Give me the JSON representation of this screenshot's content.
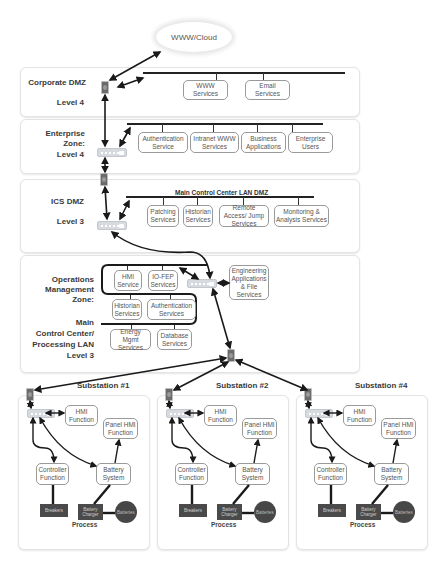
{
  "cloud": {
    "label": "WWW/Cloud"
  },
  "zones": {
    "corporate_dmz": {
      "title": "Corporate DMZ",
      "level": "Level 4",
      "services": [
        "WWW Services",
        "Email Services"
      ]
    },
    "enterprise": {
      "title": "Enterprise Zone:",
      "level": "Level 4",
      "services": [
        "Authentication Service",
        "Intranet WWW Services",
        "Business Applications",
        "Enterprise Users"
      ]
    },
    "ics_dmz": {
      "title": "ICS DMZ",
      "level": "Level 3",
      "bus_label": "Main Control Center LAN DMZ",
      "services": [
        "Patching Services",
        "Historian Services",
        "Remote Access/ Jump Services",
        "Monitoring & Analysis Services"
      ]
    },
    "operations": {
      "title_line1": "Operations",
      "title_line2": "Management Zone:",
      "main_line1": "Main",
      "main_line2": "Control Center/",
      "main_line3": "Processing LAN",
      "level": "Level 3",
      "services": [
        "HMI Service",
        "IO-FEP Services",
        "Historian Services",
        "Authentication Services",
        "Energy Mgmt Services",
        "Database Services"
      ],
      "engineering": "Engineering Applications & File Services"
    }
  },
  "substations": [
    {
      "title": "Substation #1",
      "hmi": "HMI Function",
      "panel_hmi": "Panel HMI Function",
      "controller": "Controller Function",
      "battery_system": "Battery System",
      "breakers": "Breakers",
      "charger": "Battery Charger",
      "batteries": "Batteries",
      "process": "Process"
    },
    {
      "title": "Substation #2",
      "hmi": "HMI Function",
      "panel_hmi": "Panel HMI Function",
      "controller": "Controller Function",
      "battery_system": "Battery System",
      "breakers": "Breakers",
      "charger": "Battery Charger",
      "batteries": "Batteries",
      "process": "Process"
    },
    {
      "title": "Substation #4",
      "hmi": "HMI Function",
      "panel_hmi": "Panel HMI Function",
      "controller": "Controller Function",
      "battery_system": "Battery System",
      "breakers": "Breakers",
      "charger": "Battery Charger",
      "batteries": "Batteries",
      "process": "Process"
    }
  ],
  "colors": {
    "wire": "#1a1a1a",
    "dark_equipment": "#4a4a4a",
    "panel_border": "#e4e4e4"
  }
}
